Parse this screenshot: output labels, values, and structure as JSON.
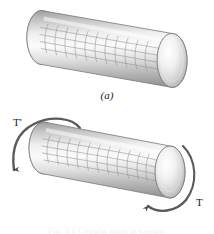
{
  "figure": {
    "background_color": "#ffffff",
    "ink_color": "#1a1a1a",
    "panels": [
      {
        "id": "a",
        "label": "(a)",
        "description": "undeformed circular shaft with square grid",
        "grid_shear_deg": 0
      },
      {
        "id": "b",
        "label": "(b)",
        "description": "shaft subjected to torque, grid sheared into parallelograms",
        "grid_shear_deg": 16
      }
    ],
    "torques": [
      {
        "name": "torque-left",
        "label": "T'",
        "position": "top-left",
        "direction": "arc-over-top-down-left"
      },
      {
        "name": "torque-right",
        "label": "T",
        "position": "bottom-right",
        "direction": "arc-around-end-face"
      }
    ],
    "cylinder": {
      "body_light": "#f4f4f4",
      "body_mid": "#c9c9c9",
      "body_dark": "#9a9a9a",
      "grid_line": "#8e8e8e",
      "endcap_light": "#fcfcfc",
      "endcap_mid": "#d5d5d5",
      "endcap_edge": "#8a8a8a",
      "outline": "#6f6f6f"
    },
    "caption_strip": "Fig. 3.1 Circular shaft in torsion."
  }
}
